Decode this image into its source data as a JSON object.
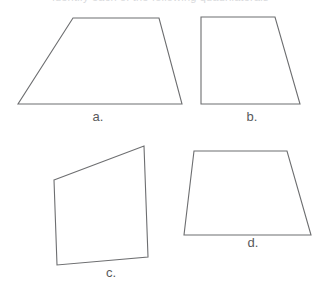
{
  "page": {
    "background_color": "#ffffff",
    "width": 321,
    "height": 282,
    "clipped_heading_text": "identify each of the following quadrilaterals"
  },
  "style": {
    "stroke_color": "#6d6e70",
    "stroke_width": 1.1,
    "fill_color": "none",
    "label_color": "#58595b"
  },
  "figures": [
    {
      "id": "shape-a",
      "label": "a.",
      "shape_kind": "trapezoid",
      "points": "73,18 159,18 182,104 18,104"
    },
    {
      "id": "shape-b",
      "label": "b.",
      "shape_kind": "right-trapezoid",
      "points": "201,17 275,17 300,104 201,104"
    },
    {
      "id": "shape-c",
      "label": "c.",
      "shape_kind": "irregular-quadrilateral",
      "points": "54,180 144,146 148,257 57,265"
    },
    {
      "id": "shape-d",
      "label": "d.",
      "shape_kind": "trapezoid",
      "points": "194,151 287,151 311,235 184,235"
    }
  ],
  "labels": {
    "a": "a.",
    "b": "b.",
    "c": "c.",
    "d": "d."
  }
}
